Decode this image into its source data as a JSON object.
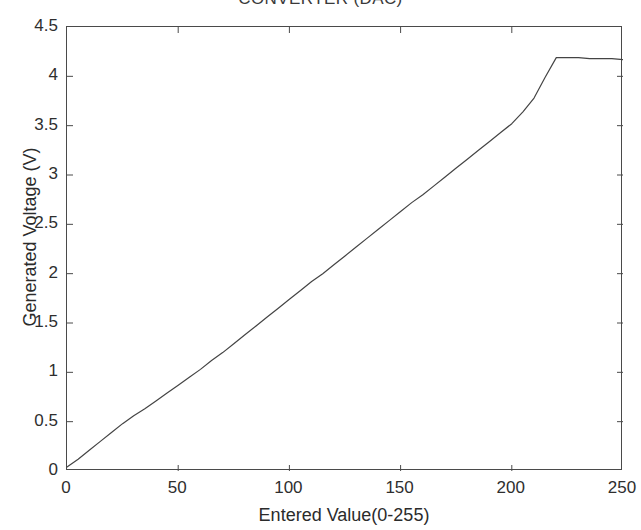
{
  "chart_data": {
    "type": "line",
    "title": "CONVERTER (DAC)",
    "xlabel": "Entered Value(0-255)",
    "ylabel": "Generated Voltage (V)",
    "xlim": [
      0,
      250
    ],
    "ylim": [
      0,
      4.5
    ],
    "xticks": [
      0,
      50,
      100,
      150,
      200,
      250
    ],
    "xtick_labels": [
      "0",
      "50",
      "100",
      "150",
      "200",
      "250"
    ],
    "yticks": [
      0,
      0.5,
      1,
      1.5,
      2,
      2.5,
      3,
      3.5,
      4,
      4.5
    ],
    "ytick_labels": [
      "0",
      "0.5",
      "1",
      "1.5",
      "2",
      "2.5",
      "3",
      "3.5",
      "4",
      "4.5"
    ],
    "grid": false,
    "legend": false,
    "box": true,
    "tick_direction": "in",
    "line_color": "#444444",
    "line_width": 1.2,
    "series": [
      {
        "name": "Generated Voltage",
        "x": [
          0,
          5,
          10,
          15,
          20,
          25,
          30,
          35,
          40,
          45,
          50,
          55,
          60,
          65,
          70,
          75,
          80,
          85,
          90,
          95,
          100,
          105,
          110,
          115,
          120,
          125,
          130,
          135,
          140,
          145,
          150,
          155,
          160,
          165,
          170,
          175,
          180,
          185,
          190,
          195,
          200,
          205,
          210,
          215,
          220,
          225,
          230,
          235,
          240,
          245,
          250
        ],
        "y": [
          0.04,
          0.12,
          0.21,
          0.3,
          0.39,
          0.48,
          0.56,
          0.63,
          0.71,
          0.79,
          0.87,
          0.95,
          1.03,
          1.12,
          1.2,
          1.29,
          1.38,
          1.47,
          1.56,
          1.65,
          1.74,
          1.83,
          1.92,
          2.0,
          2.09,
          2.18,
          2.27,
          2.36,
          2.45,
          2.54,
          2.63,
          2.72,
          2.8,
          2.89,
          2.98,
          3.07,
          3.16,
          3.25,
          3.34,
          3.43,
          3.52,
          3.64,
          3.78,
          3.99,
          4.19,
          4.19,
          4.19,
          4.18,
          4.18,
          4.18,
          4.17
        ]
      }
    ]
  }
}
